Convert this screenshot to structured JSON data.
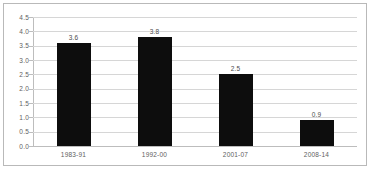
{
  "chart_data": {
    "type": "bar",
    "title": "",
    "subtitle": "",
    "xlabel": "",
    "ylabel": "",
    "categories": [
      "1983-91",
      "1992-00",
      "2001-07",
      "2008-14"
    ],
    "values": [
      3.6,
      3.8,
      2.5,
      0.9
    ],
    "data_labels": [
      "3.6",
      "3.8",
      "2.5",
      "0.9"
    ],
    "ylim": [
      0.0,
      4.5
    ],
    "ytick_step": 0.5,
    "ytick_labels": [
      "4.5",
      "4.0",
      "3.5",
      "3.0",
      "2.5",
      "2.0",
      "1.5",
      "1.0",
      "0.5",
      "0.0"
    ],
    "ytick_values": [
      4.5,
      4.0,
      3.5,
      3.0,
      2.5,
      2.0,
      1.5,
      1.0,
      0.5,
      0.0
    ],
    "grid": true,
    "grid_axis": "y",
    "legend": false,
    "legend_position": "none",
    "bar_color": "#0d0d0d",
    "gridline_color": "#d6d6d6",
    "axis_color": "#bdbdbd",
    "label_color": "#5e5e5e",
    "plot_background": "#ffffff",
    "border_color": "#b9b9b9"
  }
}
